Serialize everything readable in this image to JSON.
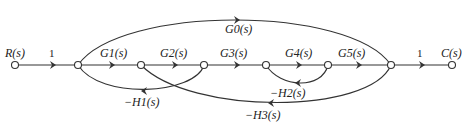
{
  "diagram": {
    "type": "signal-flow-graph",
    "input_label": "R(s)",
    "output_label": "C(s)",
    "nodes": [
      {
        "id": "n0",
        "x": 15,
        "y": 65
      },
      {
        "id": "n1",
        "x": 78,
        "y": 65
      },
      {
        "id": "n2",
        "x": 141,
        "y": 65
      },
      {
        "id": "n3",
        "x": 204,
        "y": 65
      },
      {
        "id": "n4",
        "x": 266,
        "y": 65
      },
      {
        "id": "n5",
        "x": 328,
        "y": 65
      },
      {
        "id": "n6",
        "x": 391,
        "y": 65
      },
      {
        "id": "n7",
        "x": 452,
        "y": 65
      }
    ],
    "edges": {
      "input_gain": "1",
      "g1": "G1(s)",
      "g2": "G2(s)",
      "g3": "G3(s)",
      "g4": "G4(s)",
      "g5": "G5(s)",
      "output_gain": "1",
      "g0": "G0(s)",
      "h1": "−H1(s)",
      "h2": "−H2(s)",
      "h3": "−H3(s)"
    }
  }
}
